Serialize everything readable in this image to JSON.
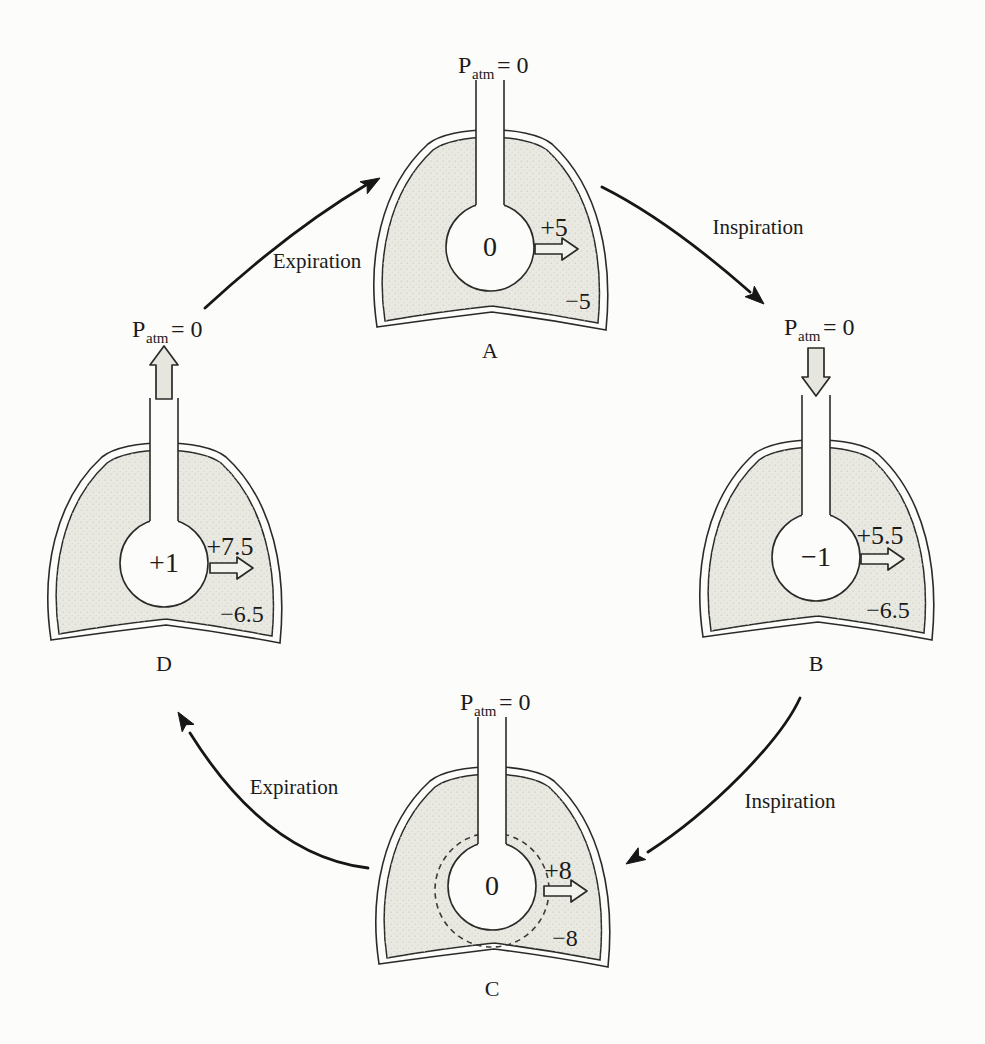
{
  "patm": {
    "symbol": "P",
    "subscript": "atm",
    "equals": "= 0"
  },
  "cycle_arrows": {
    "top_left_label": "Expiration",
    "top_right_label": "Inspiration",
    "bottom_right_label": "Inspiration",
    "bottom_left_label": "Expiration"
  },
  "diagrams": {
    "A": {
      "letter": "A",
      "alveolar_pressure": "0",
      "transpulmonary_pressure": "+5",
      "intrapleural_pressure": "−5"
    },
    "B": {
      "letter": "B",
      "alveolar_pressure": "−1",
      "transpulmonary_pressure": "+5.5",
      "intrapleural_pressure": "−6.5"
    },
    "C": {
      "letter": "C",
      "alveolar_pressure": "0",
      "transpulmonary_pressure": "+8",
      "intrapleural_pressure": "−8"
    },
    "D": {
      "letter": "D",
      "alveolar_pressure": "+1",
      "transpulmonary_pressure": "+7.5",
      "intrapleural_pressure": "−6.5"
    }
  },
  "colors": {
    "background": "#fcfcfa",
    "line": "#2a2a28",
    "lung_fill": "#e9e9e2",
    "flow_arrow_fill": "#e6e6df",
    "trans_arrow_fill": "#f3f3ed"
  }
}
